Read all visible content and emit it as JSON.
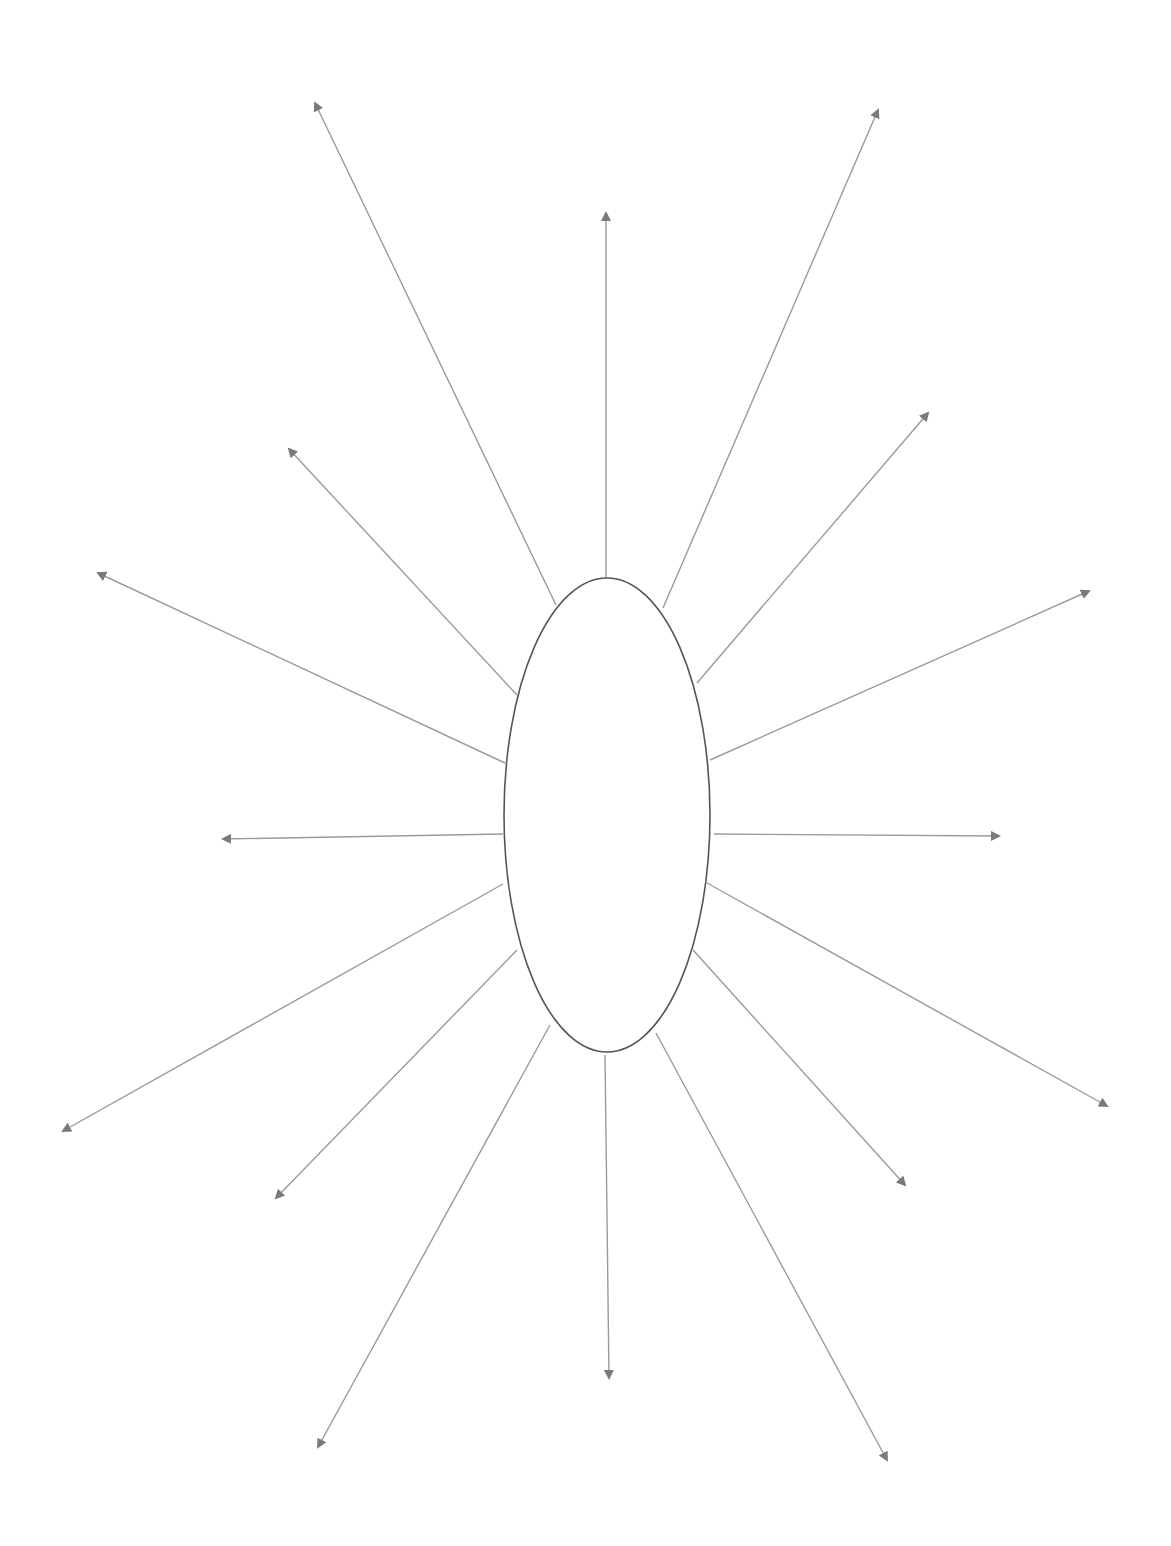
{
  "canvas": {
    "width": 1171,
    "height": 1546,
    "background": "#ffffff"
  },
  "colors": {
    "ellipse_stroke": "#555555",
    "arrow_stroke": "#9a9a9a",
    "arrow_head": "#7a7a7a"
  },
  "diagram": {
    "type": "radial-spider",
    "center_shape": {
      "shape": "ellipse",
      "cx": 607,
      "cy": 815,
      "rx": 103,
      "ry": 237,
      "label": ""
    },
    "arrows": [
      {
        "x1": 556,
        "y1": 605,
        "x2": 315,
        "y2": 103
      },
      {
        "x1": 606,
        "y1": 577,
        "x2": 606,
        "y2": 213
      },
      {
        "x1": 663,
        "y1": 608,
        "x2": 878,
        "y2": 110
      },
      {
        "x1": 697,
        "y1": 683,
        "x2": 928,
        "y2": 413
      },
      {
        "x1": 710,
        "y1": 760,
        "x2": 1089,
        "y2": 591
      },
      {
        "x1": 714,
        "y1": 834,
        "x2": 999,
        "y2": 836
      },
      {
        "x1": 707,
        "y1": 883,
        "x2": 1107,
        "y2": 1106
      },
      {
        "x1": 693,
        "y1": 950,
        "x2": 905,
        "y2": 1185
      },
      {
        "x1": 656,
        "y1": 1033,
        "x2": 887,
        "y2": 1460
      },
      {
        "x1": 605,
        "y1": 1055,
        "x2": 609,
        "y2": 1378
      },
      {
        "x1": 550,
        "y1": 1025,
        "x2": 318,
        "y2": 1447
      },
      {
        "x1": 517,
        "y1": 950,
        "x2": 276,
        "y2": 1198
      },
      {
        "x1": 503,
        "y1": 884,
        "x2": 63,
        "y2": 1131
      },
      {
        "x1": 503,
        "y1": 834,
        "x2": 223,
        "y2": 839
      },
      {
        "x1": 505,
        "y1": 763,
        "x2": 98,
        "y2": 573
      },
      {
        "x1": 517,
        "y1": 695,
        "x2": 289,
        "y2": 449
      }
    ]
  }
}
